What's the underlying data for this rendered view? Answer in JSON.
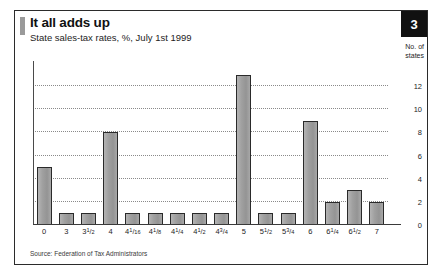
{
  "header": {
    "title": "It all adds up",
    "subtitle": "State sales-tax rates, %, July 1st 1999",
    "badge": "3"
  },
  "axis_caption_line1": "No. of",
  "axis_caption_line2": "states",
  "source": "Source: Federation of Tax Administrators",
  "colors": {
    "bar_fill": "#9d9d9d",
    "bar_stroke": "#2a2a2a",
    "badge_bg": "#111111",
    "frame": "#2b2b2b",
    "gridline": "#8a8a8a",
    "title_accent": "#9a9a9a"
  },
  "chart_data": {
    "type": "bar",
    "title": "It all adds up",
    "subtitle": "State sales-tax rates, %, July 1st 1999",
    "xlabel": "",
    "ylabel": "No. of states",
    "ylim": [
      0,
      14
    ],
    "yticks": [
      0,
      2,
      4,
      6,
      8,
      10,
      12
    ],
    "grid": true,
    "legend": false,
    "categories": [
      "0",
      "3",
      "3¹⁄₂",
      "4",
      "4¹⁄₁₆",
      "4¹⁄₈",
      "4¹⁄₄",
      "4¹⁄₂",
      "4³⁄₄",
      "5",
      "5¹⁄₂",
      "5³⁄₄",
      "6",
      "6¹⁄₄",
      "6¹⁄₂",
      "7"
    ],
    "category_parts": [
      {
        "whole": "0",
        "num": "",
        "den": ""
      },
      {
        "whole": "3",
        "num": "",
        "den": ""
      },
      {
        "whole": "3",
        "num": "1",
        "den": "2"
      },
      {
        "whole": "4",
        "num": "",
        "den": ""
      },
      {
        "whole": "4",
        "num": "1",
        "den": "16"
      },
      {
        "whole": "4",
        "num": "1",
        "den": "8"
      },
      {
        "whole": "4",
        "num": "1",
        "den": "4"
      },
      {
        "whole": "4",
        "num": "1",
        "den": "2"
      },
      {
        "whole": "4",
        "num": "3",
        "den": "4"
      },
      {
        "whole": "5",
        "num": "",
        "den": ""
      },
      {
        "whole": "5",
        "num": "1",
        "den": "2"
      },
      {
        "whole": "5",
        "num": "3",
        "den": "4"
      },
      {
        "whole": "6",
        "num": "",
        "den": ""
      },
      {
        "whole": "6",
        "num": "1",
        "den": "4"
      },
      {
        "whole": "6",
        "num": "1",
        "den": "2"
      },
      {
        "whole": "7",
        "num": "",
        "den": ""
      }
    ],
    "values": [
      5,
      1,
      1,
      8,
      1,
      1,
      1,
      1,
      1,
      13,
      1,
      1,
      9,
      2,
      3,
      2
    ]
  }
}
